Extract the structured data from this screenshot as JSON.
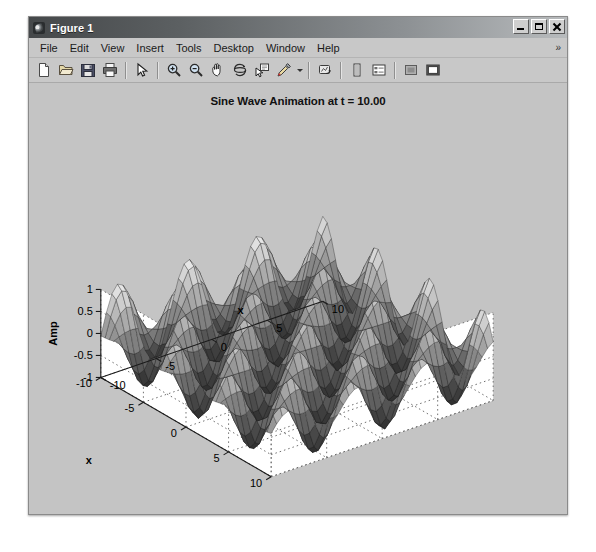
{
  "window": {
    "title": "Figure 1",
    "icon": "matlab-membrane-icon",
    "buttons": {
      "minimize": "_",
      "maximize": "□",
      "close": "✕"
    }
  },
  "menubar": {
    "items": [
      {
        "label": "File"
      },
      {
        "label": "Edit"
      },
      {
        "label": "View"
      },
      {
        "label": "Insert"
      },
      {
        "label": "Tools"
      },
      {
        "label": "Desktop"
      },
      {
        "label": "Window"
      },
      {
        "label": "Help"
      }
    ],
    "overflow": "»"
  },
  "toolbar": {
    "groups": [
      {
        "buttons": [
          {
            "name": "new-figure-icon",
            "tip": "New Figure"
          },
          {
            "name": "open-file-icon",
            "tip": "Open File"
          },
          {
            "name": "save-figure-icon",
            "tip": "Save Figure"
          },
          {
            "name": "print-figure-icon",
            "tip": "Print Figure"
          }
        ]
      },
      {
        "buttons": [
          {
            "name": "edit-plot-pointer-icon",
            "tip": "Edit Plot"
          }
        ]
      },
      {
        "buttons": [
          {
            "name": "zoom-in-icon",
            "tip": "Zoom In"
          },
          {
            "name": "zoom-out-icon",
            "tip": "Zoom Out"
          },
          {
            "name": "pan-hand-icon",
            "tip": "Pan"
          },
          {
            "name": "rotate-3d-icon",
            "tip": "Rotate 3D"
          },
          {
            "name": "data-cursor-icon",
            "tip": "Data Cursor"
          },
          {
            "name": "brush-data-icon",
            "tip": "Brush/Select Data"
          }
        ]
      },
      {
        "buttons": [
          {
            "name": "link-plot-icon",
            "tip": "Link Plot"
          }
        ]
      },
      {
        "buttons": [
          {
            "name": "insert-colorbar-icon",
            "tip": "Insert Colorbar"
          },
          {
            "name": "insert-legend-icon",
            "tip": "Insert Legend"
          }
        ]
      },
      {
        "buttons": [
          {
            "name": "hide-plot-tools-icon",
            "tip": "Hide Plot Tools"
          },
          {
            "name": "show-plot-tools-icon",
            "tip": "Show Plot Tools and Dock Figure"
          }
        ]
      }
    ]
  },
  "chart_data": {
    "type": "surface",
    "title": "Sine Wave Animation at t = 10.00",
    "xlabel": "x",
    "ylabel": "x",
    "zlabel": "Amp",
    "xlim": [
      -10,
      10
    ],
    "ylim": [
      -10,
      10
    ],
    "zlim": [
      -1,
      1
    ],
    "xticks": [
      -10,
      -5,
      0,
      5,
      10
    ],
    "yticks": [
      -10,
      -5,
      0,
      5,
      10
    ],
    "zticks": [
      -1,
      -0.5,
      0,
      0.5,
      1
    ],
    "xtick_labels": [
      "-10",
      "-5",
      "0",
      "5",
      "10"
    ],
    "ytick_labels": [
      "-10",
      "-5",
      "0",
      "5",
      "10"
    ],
    "ztick_labels": [
      "-1",
      "-0.5",
      "0",
      "0.5",
      "1"
    ],
    "grid": true,
    "colormap": "gray",
    "shading": "faceted",
    "time_t": 10.0,
    "expression": "sin(sqrt-free separable): z = sin(x + t) * sin(y + t) scaled",
    "formula": "z = sin(x + t) .* cos(y + t)",
    "mesh_n": 41,
    "view_azimuth": -37.5,
    "view_elevation": 30,
    "zvalue_range": [
      -1,
      1
    ],
    "peaks_per_axis": 3.2
  }
}
